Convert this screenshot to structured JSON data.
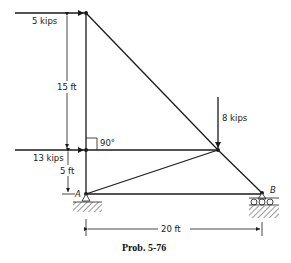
{
  "diagram": {
    "caption": "Prob. 5-76",
    "loads": {
      "top_horizontal": "5 kips",
      "middle_horizontal": "13 kips",
      "vertical": "8 kips"
    },
    "dimensions": {
      "upper_height": "15 ft",
      "lower_height": "5 ft",
      "span": "20 ft"
    },
    "angle_label": "90°",
    "supports": {
      "left": "A",
      "right": "B"
    },
    "colors": {
      "line": "#1a1a1a",
      "background": "#ffffff"
    }
  }
}
